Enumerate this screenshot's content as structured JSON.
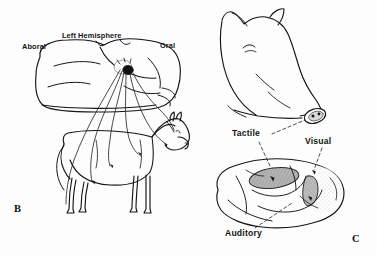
{
  "figure": {
    "background_color": "#fdfdfd",
    "ink_color": "#151515",
    "shade_color": "#a9a9a9"
  },
  "panels": [
    {
      "letter": "B",
      "name": "horse-brain-projection-panel",
      "labels": {
        "aboral": "Aboral",
        "hemisphere": "Left Hemisphere",
        "oral": "Oral"
      },
      "subject": "horse",
      "focus_name": "sensory-focus-spot"
    },
    {
      "letter": "C",
      "name": "pig-sensory-cortex-panel",
      "labels": {
        "tactile": "Tactile",
        "visual": "Visual",
        "auditory": "Auditory"
      },
      "subject": "pig"
    }
  ]
}
